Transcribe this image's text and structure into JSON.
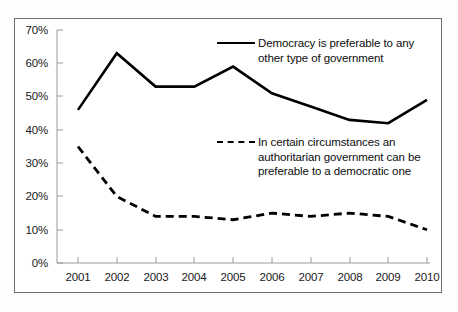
{
  "chart_data": {
    "type": "line",
    "title": "",
    "xlabel": "",
    "ylabel": "",
    "categories": [
      "2001",
      "2002",
      "2003",
      "2004",
      "2005",
      "2006",
      "2007",
      "2008",
      "2009",
      "2010"
    ],
    "ylim": [
      0,
      70
    ],
    "ytick_values": [
      0,
      10,
      20,
      30,
      40,
      50,
      60,
      70
    ],
    "ytick_labels": [
      "0%",
      "10%",
      "20%",
      "30%",
      "40%",
      "50%",
      "60%",
      "70%"
    ],
    "grid": false,
    "legend_position": "inside-right",
    "series": [
      {
        "name": "Democracy is preferable to any other type of government",
        "style": "solid",
        "color": "#000000",
        "values": [
          46,
          63,
          53,
          53,
          59,
          51,
          47,
          43,
          42,
          49
        ]
      },
      {
        "name": "In certain circumstances an authoritarian government can be preferable to a democratic one",
        "style": "dashed",
        "color": "#000000",
        "values": [
          35,
          20,
          14,
          14,
          13,
          15,
          14,
          15,
          14,
          10
        ]
      }
    ]
  },
  "legend": {
    "democracy": "Democracy is preferable to any other type of government",
    "authoritarian": "In certain circumstances an authoritarian government can be preferable to a democratic one"
  },
  "axis": {
    "y_labels": [
      "70%",
      "60%",
      "50%",
      "40%",
      "30%",
      "20%",
      "10%",
      "0%"
    ],
    "x_labels": [
      "2001",
      "2002",
      "2003",
      "2004",
      "2005",
      "2006",
      "2007",
      "2008",
      "2009",
      "2010"
    ]
  }
}
